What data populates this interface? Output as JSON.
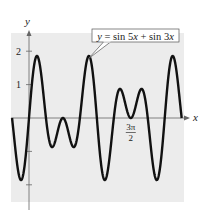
{
  "chart_data": {
    "type": "line",
    "title": "",
    "xlabel": "x",
    "ylabel": "y",
    "function": "sin(5x) + sin(3x)",
    "series": [
      {
        "name": "y = sin 5x + sin 3x",
        "expression": "sin5x+sin3x",
        "domain": [
          -0.7854,
          7.0686
        ]
      }
    ],
    "xlim": [
      -0.7854,
      7.25
    ],
    "ylim": [
      -2.5,
      2.5
    ],
    "y_ticks": [
      {
        "value": 2,
        "label": "2"
      },
      {
        "value": 1,
        "label": "1"
      },
      {
        "value": -1,
        "label": ""
      },
      {
        "value": -2,
        "label": ""
      }
    ],
    "x_ticks": [
      {
        "value": 4.7124,
        "label_num": "3π",
        "label_den": "2"
      }
    ],
    "annotation": {
      "text_parts": [
        "y",
        " = sin 5",
        "x",
        " + sin 3",
        "x"
      ],
      "points_to_x": 2.7
    },
    "grid": false,
    "background": "#ececec",
    "line_color": "#111111"
  }
}
